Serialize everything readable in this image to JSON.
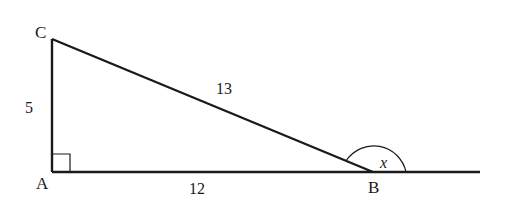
{
  "diagram": {
    "type": "right-triangle",
    "vertices": {
      "A": {
        "label": "A",
        "x": 52,
        "y": 172
      },
      "B": {
        "label": "B",
        "x": 373,
        "y": 172
      },
      "C": {
        "label": "C",
        "x": 52,
        "y": 39
      }
    },
    "sides": {
      "AC": {
        "label": "5"
      },
      "AB": {
        "label": "12"
      },
      "BC": {
        "label": "13"
      }
    },
    "angle": {
      "vertex": "B",
      "label": "x",
      "kind": "exterior"
    },
    "right_angle_at": "A",
    "extension_end_x": 480,
    "stroke_color": "#1a1a1a"
  }
}
